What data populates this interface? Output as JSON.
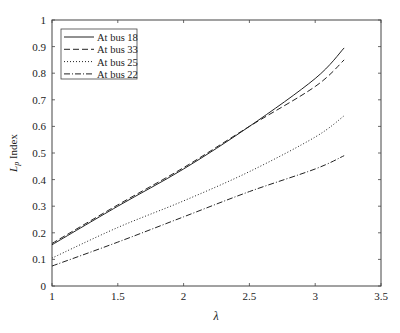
{
  "chart_data": {
    "type": "line",
    "title": "",
    "xlabel": "λ",
    "ylabel": "L_p Index",
    "xlim": [
      1,
      3.5
    ],
    "ylim": [
      0,
      1
    ],
    "grid": false,
    "legend_position": "upper left",
    "x_ticks": [
      "1",
      "1.5",
      "2",
      "2.5",
      "3",
      "3.5"
    ],
    "y_ticks": [
      "0",
      "0.1",
      "0.2",
      "0.3",
      "0.4",
      "0.5",
      "0.6",
      "0.7",
      "0.8",
      "0.9",
      "1"
    ],
    "x": [
      1.0,
      1.5,
      2.0,
      2.5,
      3.0,
      3.22
    ],
    "series": [
      {
        "name": "At bus 18",
        "style": "solid",
        "values": [
          0.155,
          0.3,
          0.44,
          0.6,
          0.78,
          0.895
        ]
      },
      {
        "name": "At bus 33",
        "style": "dashed",
        "values": [
          0.16,
          0.305,
          0.445,
          0.6,
          0.75,
          0.85
        ]
      },
      {
        "name": "At bus 25",
        "style": "dotted",
        "values": [
          0.105,
          0.22,
          0.32,
          0.43,
          0.56,
          0.64
        ]
      },
      {
        "name": "At bus 22",
        "style": "dashdot",
        "values": [
          0.075,
          0.165,
          0.26,
          0.355,
          0.44,
          0.49
        ]
      }
    ]
  }
}
